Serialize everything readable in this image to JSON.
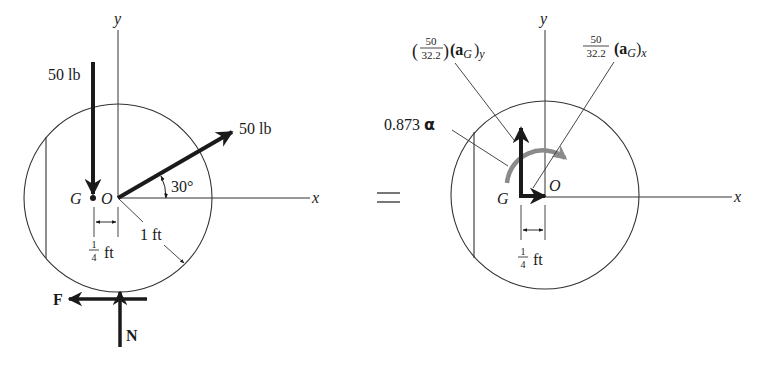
{
  "free_body_diagram": {
    "axes": {
      "x_label": "x",
      "y_label": "y"
    },
    "origin_label": "O",
    "center_of_mass_label": "G",
    "forces": [
      {
        "label": "50 lb",
        "direction": "down",
        "applied_at": "G"
      },
      {
        "label": "50 lb",
        "direction": "30° above +x",
        "applied_at": "O"
      },
      {
        "label": "F",
        "direction": "left",
        "applied_at": "contact point"
      },
      {
        "label": "N",
        "direction": "up",
        "applied_at": "contact point"
      }
    ],
    "angle_label": "30°",
    "radius_label": "1 ft",
    "offset": {
      "numerator": "1",
      "denominator": "4",
      "unit": "ft"
    }
  },
  "equals_sign": "=",
  "kinetic_diagram": {
    "axes": {
      "x_label": "x",
      "y_label": "y"
    },
    "origin_label": "O",
    "center_of_mass_label": "G",
    "moment_label": {
      "value": "0.873",
      "symbol": "α"
    },
    "ay_label": {
      "open": "(",
      "numerator": "50",
      "denominator": "32.2",
      "close": ")",
      "term": "(a",
      "subscript": "G",
      "suffix": ")",
      "component": "y"
    },
    "ax_label": {
      "numerator": "50",
      "denominator": "32.2",
      "term": "(a",
      "subscript": "G",
      "suffix": ")",
      "component": "x"
    },
    "offset": {
      "numerator": "1",
      "denominator": "4",
      "unit": "ft"
    }
  },
  "colors": {
    "ink": "#1a1a1a",
    "line": "#333333",
    "moment_gray": "#8a8a8a"
  }
}
